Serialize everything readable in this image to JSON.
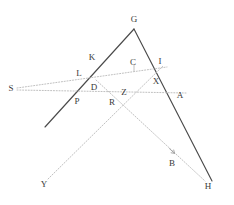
{
  "figure": {
    "type": "geometry-diagram",
    "width": 234,
    "height": 205,
    "background_color": "#ffffff",
    "solid_line_color": "#4a4a4a",
    "dotted_line_color": "#b9b9b9",
    "label_color": "#3a3a3a"
  },
  "labels": [
    {
      "id": "G",
      "text": "G",
      "x": 134,
      "y": 19
    },
    {
      "id": "K",
      "text": "K",
      "x": 92,
      "y": 57
    },
    {
      "id": "C",
      "text": "C",
      "x": 133,
      "y": 62
    },
    {
      "id": "I",
      "text": "I",
      "x": 160,
      "y": 61
    },
    {
      "id": "L",
      "text": "L",
      "x": 79,
      "y": 73
    },
    {
      "id": "X",
      "text": "X",
      "x": 156,
      "y": 81
    },
    {
      "id": "S",
      "text": "S",
      "x": 11,
      "y": 88
    },
    {
      "id": "D",
      "text": "D",
      "x": 94,
      "y": 87
    },
    {
      "id": "Z",
      "text": "Z",
      "x": 124,
      "y": 92
    },
    {
      "id": "A",
      "text": "A",
      "x": 180,
      "y": 95
    },
    {
      "id": "P",
      "text": "P",
      "x": 77,
      "y": 101
    },
    {
      "id": "R",
      "text": "R",
      "x": 112,
      "y": 102
    },
    {
      "id": "B",
      "text": "B",
      "x": 172,
      "y": 163
    },
    {
      "id": "Y",
      "text": "Y",
      "x": 44,
      "y": 184
    },
    {
      "id": "H",
      "text": "H",
      "x": 208,
      "y": 186
    }
  ],
  "solid_segments": [
    {
      "id": "left-leg",
      "name": "segment-G-to-lower-left",
      "x1": 134,
      "y1": 29,
      "x2": 45,
      "y2": 127
    },
    {
      "id": "right-leg",
      "name": "segment-G-to-H",
      "x1": 134,
      "y1": 29,
      "x2": 212,
      "y2": 181
    }
  ],
  "dotted_segments": [
    {
      "id": "s-to-i",
      "name": "ray-S-through-L-to-I",
      "x1": 17,
      "y1": 88,
      "x2": 167,
      "y2": 67
    },
    {
      "id": "s-to-a",
      "name": "ray-S-through-P-R-to-A",
      "x1": 17,
      "y1": 90,
      "x2": 186,
      "y2": 93
    },
    {
      "id": "d-to-h",
      "name": "ray-D-through-Z-to-H",
      "x1": 96,
      "y1": 80,
      "x2": 205,
      "y2": 181
    },
    {
      "id": "y-to-i",
      "name": "ray-Y-through-R-Z-to-I",
      "x1": 48,
      "y1": 179,
      "x2": 163,
      "y2": 66
    },
    {
      "id": "c-tick",
      "name": "tick-at-C",
      "x1": 134,
      "y1": 65,
      "x2": 134,
      "y2": 71
    }
  ],
  "markers": [
    {
      "id": "arrow-to-h",
      "name": "direction-arrow-toward-H",
      "x": 172,
      "y": 151,
      "angle": 43
    }
  ]
}
